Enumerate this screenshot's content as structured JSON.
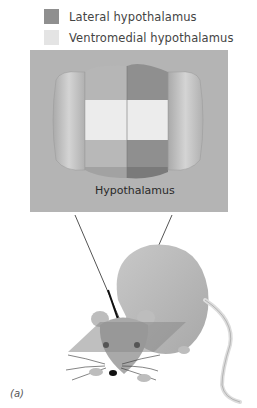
{
  "legend": {
    "items": [
      {
        "label": "Lateral hypothalamus",
        "color": "#8f8f8f"
      },
      {
        "label": "Ventromedial hypothalamus",
        "color": "#e4e4e4"
      }
    ]
  },
  "diagram": {
    "structure_label": "Hypothalamus",
    "panel_color": "#b4b4b4",
    "panel_label": "(a)"
  }
}
